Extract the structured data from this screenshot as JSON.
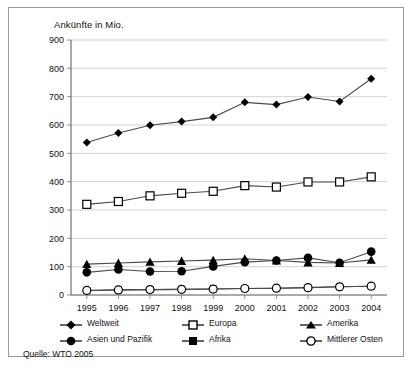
{
  "figure": {
    "title": "Ankünfte in Mio.",
    "source": "Quelle: WTO 2005"
  },
  "legend": {
    "items": [
      {
        "label": "Weltweit",
        "marker": "filled-diamond-icon"
      },
      {
        "label": "Europa",
        "marker": "open-square-icon"
      },
      {
        "label": "Amerika",
        "marker": "filled-triangle-icon"
      },
      {
        "label": "Asien und Pazifik",
        "marker": "filled-circle-icon"
      },
      {
        "label": "Afrika",
        "marker": "filled-square-icon"
      },
      {
        "label": "Mittlerer Osten",
        "marker": "open-circle-icon"
      }
    ]
  },
  "chart_data": {
    "type": "line",
    "title": "Ankünfte in Mio.",
    "xlabel": "",
    "ylabel": "Ankünfte in Mio.",
    "ylim": [
      0,
      900
    ],
    "yticks": [
      0,
      100,
      200,
      300,
      400,
      500,
      600,
      700,
      800,
      900
    ],
    "grid": true,
    "legend_position": "bottom",
    "categories": [
      "1995",
      "1996",
      "1997",
      "1998",
      "1999",
      "2000",
      "2001",
      "2002",
      "2003",
      "2004"
    ],
    "series": [
      {
        "name": "Weltweit",
        "marker": "filled-diamond",
        "values": [
          538,
          572,
          599,
          612,
          627,
          680,
          672,
          699,
          683,
          763
        ]
      },
      {
        "name": "Europa",
        "marker": "open-square",
        "values": [
          320,
          330,
          350,
          359,
          366,
          386,
          381,
          399,
          399,
          417
        ]
      },
      {
        "name": "Amerika",
        "marker": "filled-triangle",
        "values": [
          109,
          113,
          117,
          120,
          123,
          128,
          122,
          115,
          113,
          124
        ]
      },
      {
        "name": "Asien und Pazifik",
        "marker": "filled-circle",
        "values": [
          80,
          90,
          83,
          84,
          101,
          116,
          122,
          131,
          114,
          153
        ]
      },
      {
        "name": "Afrika",
        "marker": "filled-square",
        "values": [
          16,
          18,
          19,
          20,
          21,
          23,
          24,
          26,
          29,
          31
        ]
      },
      {
        "name": "Mittlerer Osten",
        "marker": "open-circle",
        "values": [
          16,
          18,
          19,
          20,
          21,
          23,
          24,
          26,
          29,
          31
        ]
      }
    ]
  }
}
